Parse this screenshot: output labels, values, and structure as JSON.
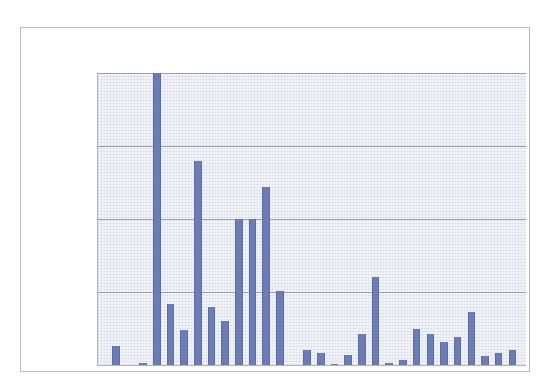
{
  "chart_data": {
    "type": "bar",
    "title": "",
    "subtitle": "",
    "xlabel": "",
    "ylabel": "",
    "xlim": [
      1979.2,
      2010.5
    ],
    "ylim": [
      0,
      2000
    ],
    "ytick_labels": [
      "0",
      "500",
      "1000",
      "1500",
      "2000"
    ],
    "ytick_values": [
      0,
      500,
      1000,
      1500,
      2000
    ],
    "xtick_labels": [
      "1980",
      "1985",
      "1990",
      "1995",
      "2000",
      "2005",
      "2010"
    ],
    "xtick_values": [
      1980,
      1985,
      1990,
      1995,
      2000,
      2005,
      2010
    ],
    "grid": "horizontal",
    "legend": "none",
    "bar_color": "#6c7cb4",
    "plot_background": "#f2f4f7",
    "categories": [
      1980,
      1981,
      1982,
      1983,
      1984,
      1985,
      1986,
      1987,
      1988,
      1989,
      1990,
      1991,
      1992,
      1993,
      1994,
      1995,
      1996,
      1997,
      1998,
      1999,
      2000,
      2001,
      2002,
      2003,
      2004,
      2005,
      2006,
      2007,
      2008,
      2009
    ],
    "values": [
      130,
      0,
      15,
      2000,
      420,
      240,
      1400,
      400,
      300,
      1000,
      1000,
      1220,
      510,
      0,
      105,
      80,
      8,
      70,
      210,
      600,
      15,
      35,
      245,
      210,
      155,
      195,
      360,
      65,
      85,
      100
    ],
    "series": [
      {
        "name": "count",
        "values": [
          130,
          0,
          15,
          2000,
          420,
          240,
          1400,
          400,
          300,
          1000,
          1000,
          1220,
          510,
          0,
          105,
          80,
          8,
          70,
          210,
          600,
          15,
          35,
          245,
          210,
          155,
          195,
          360,
          65,
          85,
          100
        ]
      }
    ]
  }
}
